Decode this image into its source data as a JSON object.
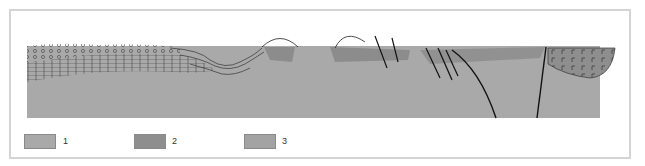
{
  "figure": {
    "type": "geological cross-section",
    "colors": {
      "unit_1": "#a9a9a9",
      "unit_2": "#8e8e8e",
      "unit_3": "#a3a3a3",
      "line": "#222222",
      "frame": "#d4d4d4"
    }
  },
  "legend": {
    "items": [
      {
        "label": "1",
        "color": "#a9a9a9"
      },
      {
        "label": "2",
        "color": "#8e8e8e"
      },
      {
        "label": "3",
        "color": "#a3a3a3"
      }
    ]
  }
}
